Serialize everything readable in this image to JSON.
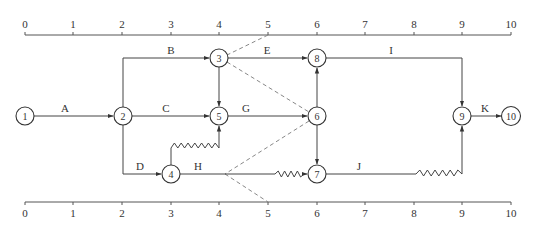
{
  "diagram": {
    "type": "time-scaled network (double-code) diagram",
    "top_axis": {
      "ticks": [
        "0",
        "1",
        "2",
        "3",
        "4",
        "5",
        "6",
        "7",
        "8",
        "9",
        "10"
      ]
    },
    "bottom_axis": {
      "ticks": [
        "0",
        "1",
        "2",
        "3",
        "4",
        "5",
        "6",
        "7",
        "8",
        "9",
        "10"
      ]
    },
    "nodes": [
      {
        "id": "1",
        "label": "1",
        "time": 0
      },
      {
        "id": "2",
        "label": "2",
        "time": 2
      },
      {
        "id": "3",
        "label": "3",
        "time": 4
      },
      {
        "id": "4",
        "label": "4",
        "time": 3
      },
      {
        "id": "5",
        "label": "5",
        "time": 4
      },
      {
        "id": "6",
        "label": "6",
        "time": 6
      },
      {
        "id": "7",
        "label": "7",
        "time": 6
      },
      {
        "id": "8",
        "label": "8",
        "time": 6
      },
      {
        "id": "9",
        "label": "9",
        "time": 9
      },
      {
        "id": "10",
        "label": "10",
        "time": 10
      }
    ],
    "activities": [
      {
        "label": "A",
        "from": "1",
        "to": "2"
      },
      {
        "label": "B",
        "from": "2",
        "to": "3"
      },
      {
        "label": "C",
        "from": "2",
        "to": "5"
      },
      {
        "label": "D",
        "from": "2",
        "to": "4"
      },
      {
        "label": "E",
        "from": "3",
        "to": "8"
      },
      {
        "label": "G",
        "from": "5",
        "to": "6"
      },
      {
        "label": "H",
        "from": "4",
        "to": "7",
        "free_float": "wavy segment 5-6"
      },
      {
        "label": "I",
        "from": "8",
        "to": "9"
      },
      {
        "label": "J",
        "from": "7",
        "to": "9",
        "free_float": "wavy segment 8-9"
      },
      {
        "label": "K",
        "from": "9",
        "to": "10"
      }
    ],
    "dummy_activities": [
      {
        "from": "3",
        "to": "5"
      },
      {
        "from": "6",
        "to": "8"
      },
      {
        "from": "6",
        "to": "7"
      },
      {
        "from": "4",
        "to": "5",
        "free_float": "wavy segment 3-4"
      }
    ],
    "frontlines": [
      {
        "description": "dashed check line: top axis 5 → node 3 → node 6 → point at time 4 on H → bottom axis 5"
      }
    ]
  }
}
